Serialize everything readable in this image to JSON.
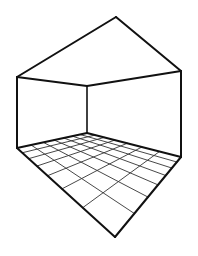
{
  "diagram": {
    "title": "",
    "colors": {
      "background": "#ffffff",
      "outline": "#111111",
      "grid": "#333333"
    },
    "vertices": {
      "roof_apex": [
        116,
        17
      ],
      "left_top": [
        17,
        77
      ],
      "right_top": [
        181,
        71
      ],
      "back_top": [
        87,
        86
      ],
      "left_bottom": [
        17,
        148
      ],
      "back_bottom": [
        87,
        133
      ],
      "right_bottom": [
        181,
        157
      ],
      "front_bottom": [
        115,
        237
      ]
    },
    "floor_grid": {
      "divisions_left_axis": 7,
      "divisions_right_axis": 7
    }
  }
}
